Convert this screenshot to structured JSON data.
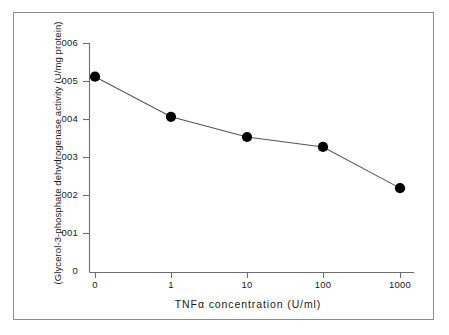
{
  "chart_data": {
    "type": "line",
    "title": "",
    "subtitle": "",
    "xlabel": "TNFα  concentration   (U/ml)",
    "ylabel": "(Glycerol-3-phosphate dehydrogenase activity  (U/mg protein)",
    "x_tick_labels": [
      "0",
      "1",
      "10",
      "100",
      "1000"
    ],
    "x_categories": [
      "0",
      "1",
      "10",
      "100",
      "1000"
    ],
    "y_tick_labels": [
      "0",
      "001",
      "002",
      "003",
      "004",
      "005",
      "006"
    ],
    "y_tick_values": [
      0,
      0.01,
      0.02,
      0.03,
      0.04,
      0.05,
      0.06
    ],
    "ylim": [
      0,
      0.06
    ],
    "grid": false,
    "legend": null,
    "series": [
      {
        "name": "Glycerol-3-phosphate dehydrogenase activity",
        "marker": "filled-circle",
        "color": "#000000",
        "values": [
          0.0513,
          0.0408,
          0.0355,
          0.0329,
          0.0221
        ]
      }
    ],
    "points": [
      {
        "x_label": "0",
        "value": 0.0513
      },
      {
        "x_label": "1",
        "value": 0.0408
      },
      {
        "x_label": "10",
        "value": 0.0355
      },
      {
        "x_label": "100",
        "value": 0.0329
      },
      {
        "x_label": "1000",
        "value": 0.0221
      }
    ],
    "colors": {
      "line": "#555555",
      "marker": "#000000",
      "axis": "#666666",
      "frame": "#8d8d8d",
      "text": "#1a1a1a",
      "background": "#ffffff"
    }
  }
}
